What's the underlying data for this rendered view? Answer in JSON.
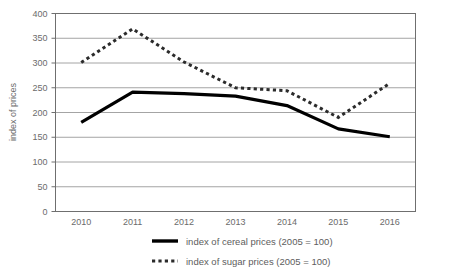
{
  "chart_data": {
    "type": "line",
    "title": "",
    "xlabel": "",
    "ylabel": "index of prices",
    "categories": [
      "2010",
      "2011",
      "2012",
      "2013",
      "2014",
      "2015",
      "2016"
    ],
    "ylim": [
      0,
      400
    ],
    "yticks": [
      0,
      50,
      100,
      150,
      200,
      250,
      300,
      350,
      400
    ],
    "grid": true,
    "legend_position": "bottom",
    "series": [
      {
        "name": "index of cereal prices (2005 = 100)",
        "style": "solid",
        "color": "#000000",
        "values": [
          180,
          241,
          238,
          233,
          214,
          167,
          151
        ]
      },
      {
        "name": "index of sugar prices (2005 = 100)",
        "style": "dotted",
        "color": "#2b2b2b",
        "values": [
          301,
          369,
          302,
          250,
          244,
          190,
          259
        ]
      }
    ]
  },
  "axis": {
    "y_title": "index of prices",
    "y_tick_labels": [
      "0",
      "50",
      "100",
      "150",
      "200",
      "250",
      "300",
      "350",
      "400"
    ],
    "x_tick_labels": [
      "2010",
      "2011",
      "2012",
      "2013",
      "2014",
      "2015",
      "2016"
    ]
  },
  "legend": {
    "items": [
      {
        "label": "index of cereal prices (2005 = 100)",
        "style": "solid"
      },
      {
        "label": "index of sugar prices (2005 = 100)",
        "style": "dotted"
      }
    ]
  }
}
